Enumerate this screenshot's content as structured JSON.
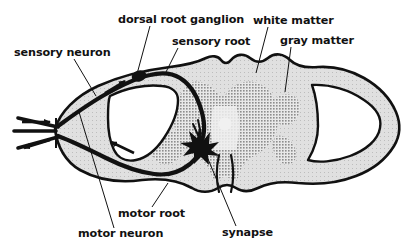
{
  "figure": {
    "width": 412,
    "height": 246,
    "background_color": "#ffffff"
  },
  "colors": {
    "outline": "#111111",
    "white_matter_fill": "#d5d5d5",
    "gray_matter_fill": "#a8a8a8",
    "nerve_fiber": "#111111",
    "ganglion": "#111111",
    "synapse": "#111111",
    "central_canal": "#ffffff",
    "lumen_white": "#ffffff",
    "label_text": "#111111",
    "leader_line": "#111111"
  },
  "labels": [
    {
      "id": "sensory-neuron",
      "text": "sensory neuron",
      "x": 14,
      "y": 56,
      "anchor": "start",
      "leader": "M 74,59 L 96,96"
    },
    {
      "id": "dorsal-root-ganglion",
      "text": "dorsal root ganglion",
      "x": 118,
      "y": 23,
      "anchor": "start",
      "leader": "M 150,26 L 137,74"
    },
    {
      "id": "sensory-root",
      "text": "sensory root",
      "x": 172,
      "y": 45,
      "anchor": "start",
      "leader": "M 178,48 L 166,72"
    },
    {
      "id": "white-matter",
      "text": "white matter",
      "x": 253,
      "y": 24,
      "anchor": "start",
      "leader": "M 268,27 L 256,73"
    },
    {
      "id": "gray-matter",
      "text": "gray matter",
      "x": 280,
      "y": 44,
      "anchor": "start",
      "leader": "M 291,47 L 285,92"
    },
    {
      "id": "motor-root",
      "text": "motor root",
      "x": 118,
      "y": 217,
      "anchor": "start",
      "leader": "M 152,207 L 168,183"
    },
    {
      "id": "motor-neuron",
      "text": "motor neuron",
      "x": 78,
      "y": 237,
      "anchor": "start",
      "leader": "M 114,228 L 79,112"
    },
    {
      "id": "synapse",
      "text": "synapse",
      "x": 222,
      "y": 236,
      "anchor": "start",
      "leader": "M 236,226 L 203,147"
    }
  ],
  "arrows": [
    {
      "id": "arrow-sensory-inbound",
      "description": "afferent into nerve",
      "path": "M 22,122 L 54,122",
      "direction": "right"
    },
    {
      "id": "arrow-motor-outbound",
      "description": "efferent out of nerve",
      "path": "M 52,134 L 20,145",
      "direction": "left"
    },
    {
      "id": "arrow-sensory-ascending",
      "description": "sensory signal toward ganglion",
      "path": "M 107,92 L 128,80",
      "direction": "upright"
    },
    {
      "id": "arrow-motor-returning",
      "description": "motor signal toward periphery",
      "path": "M 132,152 L 108,141",
      "direction": "left"
    }
  ],
  "structures": [
    {
      "id": "dura-outline",
      "name": "spinal cord outline"
    },
    {
      "id": "white-matter-region",
      "name": "white matter"
    },
    {
      "id": "gray-matter-region",
      "name": "gray matter butterfly"
    },
    {
      "id": "central-canal",
      "name": "central canal"
    },
    {
      "id": "ventral-median-fissure",
      "name": "ventral median fissure"
    },
    {
      "id": "dorsal-root-ganglion-body",
      "name": "dorsal root ganglion"
    },
    {
      "id": "synapse-burst",
      "name": "synapse"
    },
    {
      "id": "sensory-root-fiber",
      "name": "sensory root fiber"
    },
    {
      "id": "motor-root-fiber",
      "name": "motor root fiber"
    },
    {
      "id": "left-subarachnoid-space",
      "name": "left lumen"
    },
    {
      "id": "right-subarachnoid-space",
      "name": "right lumen"
    }
  ]
}
